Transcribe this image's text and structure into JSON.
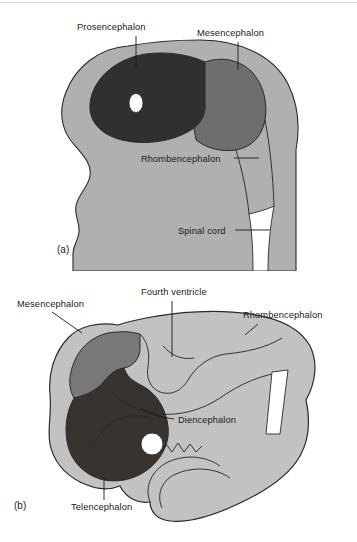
{
  "figure": {
    "background_color": "#ffffff"
  },
  "colors": {
    "mantle_light_gray": "#b0b0b0",
    "mantle_light_gray_b": "#c2c2c2",
    "mesencephalon_gray": "#6e6e6e",
    "mesencephalon_gray_b": "#787878",
    "prosencephalon_dark": "#332f2d",
    "telencephalon_dark": "#38332f",
    "outline_stroke": "#2a2a2a",
    "ventricle_white": "#ffffff",
    "text_color": "#1a1a1a",
    "top_rule": "#dcdcdc"
  },
  "panels": [
    {
      "tag": "(a)",
      "tag_x": 57,
      "tag_y": 253,
      "stage": "three primary vesicles",
      "labels": [
        {
          "id": "prosencephalon",
          "text": "Prosencephalon",
          "x": 77,
          "y": 30,
          "anchor": "start",
          "leader": "M 136 36 L 136 66"
        },
        {
          "id": "mesencephalon",
          "text": "Mesencephalon",
          "x": 197,
          "y": 36,
          "anchor": "start",
          "leader": "M 238 42 L 238 70"
        },
        {
          "id": "rhombencephalon",
          "text": "Rhombencephalon",
          "x": 141,
          "y": 162,
          "anchor": "start",
          "leader": "M 234 158 L 259 158"
        },
        {
          "id": "spinal-cord",
          "text": "Spinal cord",
          "x": 178,
          "y": 234,
          "anchor": "start",
          "leader": "M 235 230 L 270 230"
        }
      ]
    },
    {
      "tag": "(b)",
      "tag_x": 14,
      "tag_y": 509,
      "stage": "five secondary vesicles",
      "labels": [
        {
          "id": "mesencephalon",
          "text": "Mesencephalon",
          "x": 17,
          "y": 307,
          "anchor": "start",
          "leader": "M 52 312 L 82 333"
        },
        {
          "id": "fourth-ventricle",
          "text": "Fourth ventricle",
          "x": 141,
          "y": 295,
          "anchor": "start",
          "leader": "M 172 301 L 172 357"
        },
        {
          "id": "rhombencephalon",
          "text": "Rhombencephalon",
          "x": 243,
          "y": 318,
          "anchor": "start",
          "leader": "M 258 324 L 245 335"
        },
        {
          "id": "diencephalon",
          "text": "Diencephalon",
          "x": 178,
          "y": 423,
          "anchor": "start",
          "leader": "M 174 419 Q 155 417 140 408"
        },
        {
          "id": "telencephalon",
          "text": "Telencephalon",
          "x": 71,
          "y": 510,
          "anchor": "start",
          "leader": "M 104 500 L 104 478"
        }
      ]
    }
  ],
  "regions": {
    "panel_a": [
      {
        "id": "mantle",
        "name": "neural-mantle",
        "fill_key": "mantle_light_gray"
      },
      {
        "id": "prosencephalon",
        "name": "prosencephalon-vesicle",
        "fill_key": "prosencephalon_dark"
      },
      {
        "id": "optic-vesicle",
        "name": "optic-vesicle",
        "fill_key": "ventricle_white"
      },
      {
        "id": "mesencephalon",
        "name": "mesencephalon-vesicle",
        "fill_key": "mesencephalon_gray"
      },
      {
        "id": "rhombencephalon",
        "name": "rhombencephalon-segments",
        "fill_key": "mantle_light_gray"
      },
      {
        "id": "neural-canal",
        "name": "neural-canal",
        "fill_key": "ventricle_white"
      }
    ],
    "panel_b": [
      {
        "id": "mantle",
        "name": "neural-mantle",
        "fill_key": "mantle_light_gray_b"
      },
      {
        "id": "mesencephalon",
        "name": "mesencephalon-vesicle",
        "fill_key": "mesencephalon_gray_b"
      },
      {
        "id": "telencephalon",
        "name": "telencephalon-vesicle",
        "fill_key": "telencephalon_dark"
      },
      {
        "id": "optic-vesicle",
        "name": "optic-vesicle",
        "fill_key": "ventricle_white"
      },
      {
        "id": "fourth-ventricle-slit",
        "name": "fourth-ventricle-slit",
        "fill_key": "ventricle_white"
      }
    ]
  }
}
